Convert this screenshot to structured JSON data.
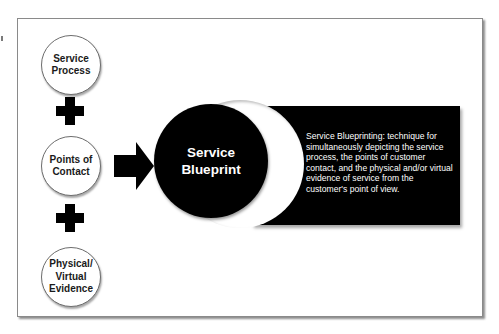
{
  "diagram": {
    "inputs": [
      {
        "label": "Service\nProcess"
      },
      {
        "label": "Points of\nContact"
      },
      {
        "label": "Physical/\nVirtual\nEvidence"
      }
    ],
    "operators": [
      "plus",
      "plus"
    ],
    "flow_icon": "arrow-right",
    "result": {
      "label": "Service\nBlueprint"
    },
    "definition": {
      "text": "Service Blueprinting: technique for simultaneously depicting the service process, the points of customer contact, and the physical and/or virtual evidence of service from the customer's point of view."
    },
    "colors": {
      "background": "#ffffff",
      "frame_border": "#8a8a8a",
      "shape_fill": "#000000",
      "circle_border": "#6d6d6d",
      "text_dark": "#1a1a1a",
      "text_light": "#ffffff"
    }
  }
}
